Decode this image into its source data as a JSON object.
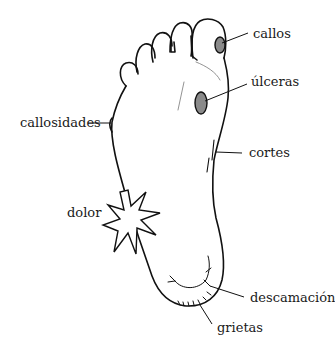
{
  "diagram": {
    "labels": {
      "callos": "callos",
      "ulceras": "úlceras",
      "callosidades": "callosidades",
      "cortes": "cortes",
      "dolor": "dolor",
      "descamacion": "descamación",
      "grietas": "grietas"
    },
    "colors": {
      "ink": "#111111",
      "text": "#1a1a1a",
      "lesion_fill": "#8a8a8a",
      "background": "#ffffff"
    }
  }
}
